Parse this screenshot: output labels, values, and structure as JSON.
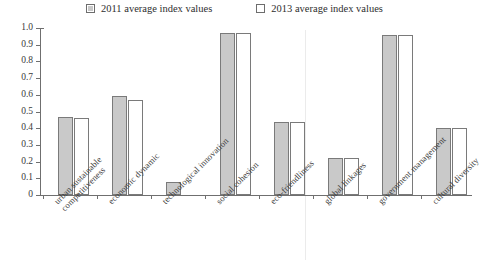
{
  "legend": {
    "entries": [
      {
        "label": "2011 average index values",
        "swatch": "filled-square-icon",
        "color": "#c9c9c9"
      },
      {
        "label": "2013 average index values",
        "swatch": "hollow-square-icon",
        "color": "#ffffff"
      }
    ]
  },
  "axis": {
    "y_ticks": [
      "1.0",
      "0.9",
      "0.8",
      "0.7",
      "0.6",
      "0.5",
      "0.4",
      "0.3",
      "0.2",
      "0.1",
      "0"
    ]
  },
  "chart_data": {
    "type": "bar",
    "title": "",
    "subtitle": "",
    "xlabel": "",
    "ylabel": "",
    "ylim": [
      0,
      1.0
    ],
    "ytick_step": 0.1,
    "grid": false,
    "legend_position": "top",
    "categories": [
      "urban sustainable competitiveness",
      "economic dynamic",
      "technological innovation",
      "social cohesion",
      "eco-friendliness",
      "global linkages",
      "government management",
      "cultural diversity"
    ],
    "category_lines": [
      [
        "urban sustainable",
        "competitiveness"
      ],
      [
        "economic dynamic"
      ],
      [
        "technological innovation"
      ],
      [
        "social cohesion"
      ],
      [
        "eco-friendliness"
      ],
      [
        "global linkages"
      ],
      [
        "government management"
      ],
      [
        "cultural diversity"
      ]
    ],
    "series": [
      {
        "name": "2011 average index values",
        "color": "#c9c9c9",
        "values": [
          0.47,
          0.59,
          0.08,
          0.97,
          0.435,
          0.22,
          0.96,
          0.4
        ]
      },
      {
        "name": "2013 average index values",
        "color": "#ffffff",
        "values": [
          0.46,
          0.57,
          0.0,
          0.97,
          0.435,
          0.22,
          0.96,
          0.4
        ]
      }
    ]
  }
}
